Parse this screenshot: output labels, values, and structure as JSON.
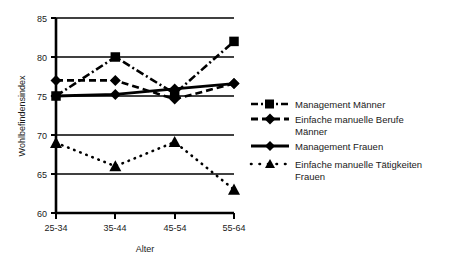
{
  "chart_data": {
    "type": "line",
    "title": "",
    "xlabel": "Alter",
    "ylabel": "Wohlbefindensindex",
    "categories": [
      "25-34",
      "35-44",
      "45-54",
      "55-64"
    ],
    "ylim": [
      60,
      85
    ],
    "yticks": [
      60,
      65,
      70,
      75,
      80,
      85
    ],
    "grid": "horizontal",
    "legend_position": "right",
    "series": [
      {
        "name": "Management Männer",
        "marker": "square",
        "linestyle": "dash-dot",
        "color": "#000000",
        "values": [
          75.0,
          80.0,
          75.3,
          82.0
        ]
      },
      {
        "name": "Einfache manuelle Berufe Männer",
        "marker": "diamond",
        "linestyle": "dashed",
        "color": "#000000",
        "values": [
          77.0,
          77.0,
          74.6,
          76.6
        ]
      },
      {
        "name": "Management Frauen",
        "marker": "diamond",
        "linestyle": "solid",
        "color": "#000000",
        "values": [
          75.0,
          75.2,
          75.9,
          76.6
        ]
      },
      {
        "name": "Einfache manuelle Tätigkeiten Frauen",
        "marker": "triangle",
        "linestyle": "dotted",
        "color": "#000000",
        "values": [
          69.0,
          66.0,
          69.1,
          63.0
        ]
      }
    ]
  },
  "axes": {
    "y_title": "Wohlbefindensindex",
    "x_title": "Alter",
    "y_ticks": [
      "85",
      "80",
      "75",
      "70",
      "65",
      "60"
    ],
    "x_ticks": [
      "25-34",
      "35-44",
      "45-54",
      "55-64"
    ]
  },
  "legend": {
    "items": [
      {
        "label": "Management Männer",
        "marker": "square-icon",
        "line": "dash-dot"
      },
      {
        "label": "Einfache manuelle Berufe",
        "label2": "Männer",
        "marker": "diamond-icon",
        "line": "dashed"
      },
      {
        "label": "Management Frauen",
        "marker": "diamond-icon",
        "line": "solid"
      },
      {
        "label": "Einfache manuelle Tätigkeiten",
        "label2": "Frauen",
        "marker": "triangle-icon",
        "line": "dotted"
      }
    ]
  },
  "colors": {
    "ink": "#000000",
    "text": "#1a1a1a",
    "background": "#ffffff"
  }
}
